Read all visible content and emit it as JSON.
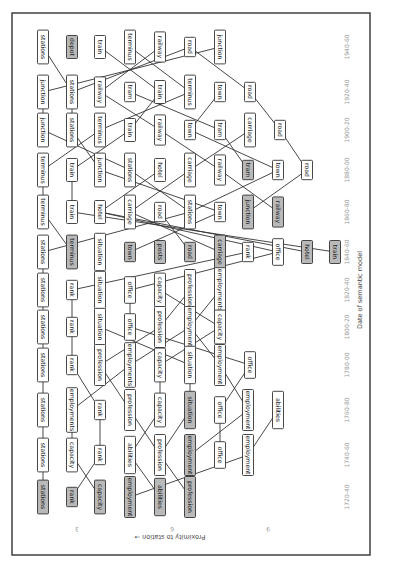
{
  "diagram": {
    "orientation": "rotated-90-clockwise",
    "x_axis": {
      "title": "Date of semantic model",
      "ticks": [
        "1720-40",
        "1740-60",
        "1760-80",
        "1780-00",
        "1800-20",
        "1820-40",
        "1840-60",
        "1860-80",
        "1880-00",
        "1900-20",
        "1920-40",
        "1940-60"
      ]
    },
    "y_axis": {
      "title": "Proximity to station →",
      "ticks": [
        "3",
        "6",
        "9"
      ]
    },
    "columns": [
      {
        "period": "1940-60",
        "y": 47,
        "nodes": [
          {
            "label": "stations",
            "x": 43
          },
          {
            "label": "depot",
            "x": 72,
            "grey": true
          },
          {
            "label": "train",
            "x": 100
          },
          {
            "label": "terminus",
            "x": 130
          },
          {
            "label": "railway",
            "x": 160
          },
          {
            "label": "road",
            "x": 190
          },
          {
            "label": "junction",
            "x": 220
          }
        ]
      },
      {
        "period": "1920-40",
        "y": 92,
        "nodes": [
          {
            "label": "junction",
            "x": 43
          },
          {
            "label": "stations",
            "x": 72
          },
          {
            "label": "railway",
            "x": 100
          },
          {
            "label": "tram",
            "x": 130
          },
          {
            "label": "train",
            "x": 160
          },
          {
            "label": "terminus",
            "x": 190
          },
          {
            "label": "town",
            "x": 220
          },
          {
            "label": "road",
            "x": 250
          }
        ]
      },
      {
        "period": "1900-20",
        "y": 130,
        "nodes": [
          {
            "label": "junction",
            "x": 43
          },
          {
            "label": "stations",
            "x": 72
          },
          {
            "label": "terminus",
            "x": 100
          },
          {
            "label": "train",
            "x": 130
          },
          {
            "label": "railway",
            "x": 160
          },
          {
            "label": "town",
            "x": 190
          },
          {
            "label": "tram",
            "x": 220
          },
          {
            "label": "carriage",
            "x": 250
          },
          {
            "label": "road",
            "x": 280
          }
        ]
      },
      {
        "period": "1880-00",
        "y": 170,
        "nodes": [
          {
            "label": "terminus",
            "x": 43
          },
          {
            "label": "train",
            "x": 72
          },
          {
            "label": "junction",
            "x": 100
          },
          {
            "label": "stations",
            "x": 130
          },
          {
            "label": "hotel",
            "x": 160
          },
          {
            "label": "carriage",
            "x": 190
          },
          {
            "label": "railway",
            "x": 220
          },
          {
            "label": "tram",
            "x": 248,
            "grey": true
          },
          {
            "label": "town",
            "x": 278
          },
          {
            "label": "road",
            "x": 307
          }
        ]
      },
      {
        "period": "1860-80",
        "y": 212,
        "nodes": [
          {
            "label": "terminus",
            "x": 43
          },
          {
            "label": "train",
            "x": 72
          },
          {
            "label": "hotel",
            "x": 100
          },
          {
            "label": "carriage",
            "x": 130
          },
          {
            "label": "road",
            "x": 160
          },
          {
            "label": "stations",
            "x": 190
          },
          {
            "label": "town",
            "x": 220
          },
          {
            "label": "junction",
            "x": 248,
            "grey": true
          },
          {
            "label": "railway",
            "x": 278,
            "grey": true
          }
        ]
      },
      {
        "period": "1840-60",
        "y": 252,
        "nodes": [
          {
            "label": "stations",
            "x": 43
          },
          {
            "label": "terminus",
            "x": 72,
            "grey": true
          },
          {
            "label": "situation",
            "x": 100
          },
          {
            "label": "town",
            "x": 130,
            "grey": true
          },
          {
            "label": "posts",
            "x": 160,
            "grey": true
          },
          {
            "label": "road",
            "x": 190,
            "grey": true
          },
          {
            "label": "carriage",
            "x": 220,
            "grey": true
          },
          {
            "label": "rank",
            "x": 248
          },
          {
            "label": "office",
            "x": 278
          },
          {
            "label": "hotel",
            "x": 307,
            "grey": true
          },
          {
            "label": "train",
            "x": 335,
            "grey": true
          }
        ]
      },
      {
        "period": "1820-40",
        "y": 290,
        "nodes": [
          {
            "label": "stations",
            "x": 43
          },
          {
            "label": "rank",
            "x": 72
          },
          {
            "label": "situation",
            "x": 100
          },
          {
            "label": "office",
            "x": 130
          },
          {
            "label": "capacity",
            "x": 160
          },
          {
            "label": "profession",
            "x": 190
          },
          {
            "label": "employments",
            "x": 220
          }
        ]
      },
      {
        "period": "1800-20",
        "y": 327,
        "nodes": [
          {
            "label": "stations",
            "x": 43
          },
          {
            "label": "rank",
            "x": 72
          },
          {
            "label": "situation",
            "x": 100
          },
          {
            "label": "office",
            "x": 130
          },
          {
            "label": "profession",
            "x": 160
          },
          {
            "label": "employment",
            "x": 190
          },
          {
            "label": "capacity",
            "x": 220
          }
        ]
      },
      {
        "period": "1780-00",
        "y": 365,
        "nodes": [
          {
            "label": "stations",
            "x": 43
          },
          {
            "label": "rank",
            "x": 72
          },
          {
            "label": "profession",
            "x": 100
          },
          {
            "label": "employments",
            "x": 130
          },
          {
            "label": "capacity",
            "x": 160
          },
          {
            "label": "situation",
            "x": 190
          },
          {
            "label": "employment",
            "x": 220
          },
          {
            "label": "office",
            "x": 250
          }
        ]
      },
      {
        "period": "1760-80",
        "y": 410,
        "nodes": [
          {
            "label": "stations",
            "x": 43
          },
          {
            "label": "employments",
            "x": 72
          },
          {
            "label": "rank",
            "x": 100
          },
          {
            "label": "profession",
            "x": 130
          },
          {
            "label": "capacity",
            "x": 160
          },
          {
            "label": "situation",
            "x": 190,
            "grey": true
          },
          {
            "label": "office",
            "x": 220
          },
          {
            "label": "employment",
            "x": 248
          },
          {
            "label": "abilities",
            "x": 278
          }
        ]
      },
      {
        "period": "1740-60",
        "y": 455,
        "nodes": [
          {
            "label": "stations",
            "x": 43
          },
          {
            "label": "capacity",
            "x": 72
          },
          {
            "label": "rank",
            "x": 100
          },
          {
            "label": "abilities",
            "x": 130
          },
          {
            "label": "profession",
            "x": 160
          },
          {
            "label": "employment",
            "x": 190,
            "grey": true
          },
          {
            "label": "office",
            "x": 220
          },
          {
            "label": "employment",
            "x": 248
          }
        ]
      },
      {
        "period": "1720-40",
        "y": 497,
        "nodes": [
          {
            "label": "stations",
            "x": 43,
            "grey": true
          },
          {
            "label": "rank",
            "x": 72,
            "grey": true
          },
          {
            "label": "capacity",
            "x": 100,
            "grey": true
          },
          {
            "label": "employment",
            "x": 130,
            "grey": true
          },
          {
            "label": "abilities",
            "x": 160,
            "grey": true
          },
          {
            "label": "profession",
            "x": 190,
            "grey": true
          }
        ]
      }
    ],
    "edges": [
      [
        0,
        0,
        1,
        1
      ],
      [
        0,
        2,
        1,
        4
      ],
      [
        0,
        3,
        1,
        5
      ],
      [
        0,
        4,
        1,
        2
      ],
      [
        0,
        5,
        1,
        1
      ],
      [
        0,
        5,
        1,
        7
      ],
      [
        0,
        6,
        1,
        0
      ],
      [
        1,
        0,
        2,
        0
      ],
      [
        1,
        1,
        2,
        1
      ],
      [
        1,
        2,
        2,
        4
      ],
      [
        1,
        3,
        2,
        6
      ],
      [
        1,
        4,
        2,
        3
      ],
      [
        1,
        5,
        2,
        2
      ],
      [
        1,
        6,
        2,
        5
      ],
      [
        1,
        7,
        2,
        8
      ],
      [
        2,
        0,
        3,
        3
      ],
      [
        2,
        1,
        3,
        2
      ],
      [
        2,
        2,
        3,
        0
      ],
      [
        2,
        3,
        3,
        1
      ],
      [
        2,
        4,
        3,
        6
      ],
      [
        2,
        5,
        3,
        8
      ],
      [
        2,
        6,
        3,
        7
      ],
      [
        2,
        7,
        3,
        5
      ],
      [
        2,
        8,
        3,
        9
      ],
      [
        3,
        0,
        4,
        0
      ],
      [
        3,
        1,
        4,
        1
      ],
      [
        3,
        2,
        4,
        6
      ],
      [
        3,
        3,
        4,
        5
      ],
      [
        3,
        4,
        4,
        2
      ],
      [
        3,
        5,
        4,
        3
      ],
      [
        3,
        6,
        4,
        8
      ],
      [
        3,
        8,
        4,
        5
      ],
      [
        3,
        9,
        4,
        7
      ],
      [
        4,
        0,
        5,
        1
      ],
      [
        4,
        1,
        5,
        10
      ],
      [
        4,
        2,
        5,
        9
      ],
      [
        4,
        3,
        5,
        6
      ],
      [
        4,
        4,
        5,
        5
      ],
      [
        4,
        5,
        5,
        0
      ],
      [
        4,
        6,
        5,
        3
      ],
      [
        4,
        2,
        5,
        8
      ],
      [
        5,
        0,
        6,
        0
      ],
      [
        5,
        2,
        6,
        2
      ],
      [
        5,
        7,
        6,
        1
      ],
      [
        5,
        8,
        6,
        3
      ],
      [
        6,
        0,
        7,
        0
      ],
      [
        6,
        1,
        7,
        1
      ],
      [
        6,
        2,
        7,
        2
      ],
      [
        6,
        3,
        7,
        3
      ],
      [
        6,
        4,
        7,
        6
      ],
      [
        6,
        5,
        7,
        4
      ],
      [
        6,
        6,
        7,
        5
      ],
      [
        7,
        0,
        8,
        0
      ],
      [
        7,
        1,
        8,
        1
      ],
      [
        7,
        2,
        8,
        5
      ],
      [
        7,
        3,
        8,
        7
      ],
      [
        7,
        4,
        8,
        2
      ],
      [
        7,
        5,
        8,
        6
      ],
      [
        7,
        6,
        8,
        4
      ],
      [
        7,
        5,
        8,
        3
      ],
      [
        8,
        0,
        9,
        0
      ],
      [
        8,
        1,
        9,
        2
      ],
      [
        8,
        2,
        9,
        3
      ],
      [
        8,
        3,
        9,
        1
      ],
      [
        8,
        4,
        9,
        4
      ],
      [
        8,
        5,
        9,
        5
      ],
      [
        8,
        6,
        9,
        7
      ],
      [
        8,
        7,
        9,
        6
      ],
      [
        9,
        0,
        10,
        0
      ],
      [
        9,
        1,
        10,
        1
      ],
      [
        9,
        2,
        10,
        2
      ],
      [
        9,
        3,
        10,
        4
      ],
      [
        9,
        4,
        10,
        3
      ],
      [
        9,
        5,
        10,
        4
      ],
      [
        9,
        6,
        10,
        6
      ],
      [
        9,
        7,
        10,
        5
      ],
      [
        9,
        8,
        10,
        7
      ],
      [
        10,
        0,
        11,
        0
      ],
      [
        10,
        1,
        11,
        2
      ],
      [
        10,
        2,
        11,
        1
      ],
      [
        10,
        3,
        11,
        4
      ],
      [
        10,
        4,
        11,
        5
      ],
      [
        10,
        5,
        11,
        5
      ],
      [
        10,
        7,
        11,
        3
      ]
    ]
  }
}
